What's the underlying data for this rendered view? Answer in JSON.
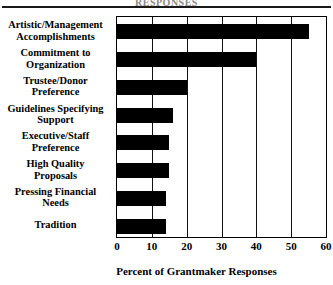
{
  "figure": {
    "title_fragment": "RESPONSES",
    "rule": "horizontal-rule"
  },
  "chart_data": {
    "type": "bar",
    "orientation": "horizontal",
    "title": "",
    "xlabel": "Percent of  Grantmaker Responses",
    "ylabel": "",
    "xlim": [
      0,
      60
    ],
    "xticks": [
      0,
      10,
      20,
      30,
      40,
      50,
      60
    ],
    "xtick_labels": [
      "0",
      "10",
      "20",
      "30",
      "40",
      "50",
      "60"
    ],
    "grid": true,
    "grid_axis": "x",
    "legend": false,
    "bar_color": "#000000",
    "categories": [
      "Artistic/Management Accomplishments",
      "Commitment to Organization",
      "Trustee/Donor Preference",
      "Guidelines Specifying Support",
      "Executive/Staff Preference",
      "High Quality Proposals",
      "Pressing Financial Needs",
      "Tradition"
    ],
    "category_lines": [
      [
        "Artistic/Management",
        "Accomplishments"
      ],
      [
        "Commitment to",
        "Organization"
      ],
      [
        "Trustee/Donor",
        "Preference"
      ],
      [
        "Guidelines Specifying",
        "Support"
      ],
      [
        "Executive/Staff",
        "Preference"
      ],
      [
        "High Quality",
        "Proposals"
      ],
      [
        "Pressing Financial",
        "Needs"
      ],
      [
        "Tradition"
      ]
    ],
    "values": [
      55,
      40,
      20,
      16,
      15,
      15,
      14,
      14
    ]
  }
}
